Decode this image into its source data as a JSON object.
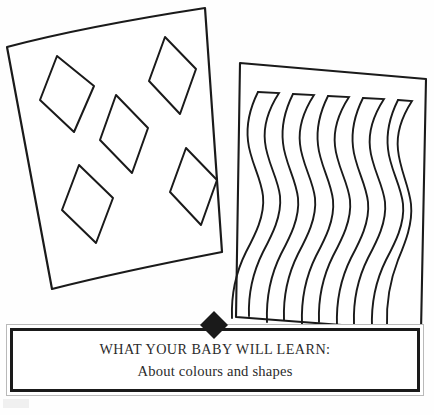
{
  "page": {
    "background_color": "#fefefe",
    "ink_color": "#1a1a1a",
    "width": 434,
    "height": 415
  },
  "illustration": {
    "description": "Line drawing of two overlapping baby stimulation cards",
    "cards": [
      {
        "name": "diamond-pattern-card",
        "label": "Card with diamond shapes",
        "rotation_deg": -12,
        "shape_count": 5,
        "shape_type": "diamond",
        "corners": [
          [
            7,
            47
          ],
          [
            205,
            8
          ],
          [
            222,
            252
          ],
          [
            52,
            289
          ]
        ],
        "shapes": [
          {
            "cx": 77,
            "cy": 93,
            "rx": 26,
            "ry": 38,
            "rot": -10
          },
          {
            "cx": 169,
            "cy": 73,
            "rx": 24,
            "ry": 35,
            "rot": -14
          },
          {
            "cx": 128,
            "cy": 131,
            "rx": 25,
            "ry": 38,
            "rot": -8
          },
          {
            "cx": 85,
            "cy": 199,
            "rx": 26,
            "ry": 38,
            "rot": -9
          },
          {
            "cx": 186,
            "cy": 185,
            "rx": 24,
            "ry": 36,
            "rot": -10
          }
        ]
      },
      {
        "name": "wavy-line-card",
        "label": "Card with vertical wavy stripes",
        "rotation_deg": 3,
        "stripe_count": 5,
        "shape_type": "wave",
        "corners": [
          [
            240,
            63
          ],
          [
            426,
            79
          ],
          [
            421,
            330
          ],
          [
            236,
            317
          ]
        ]
      }
    ]
  },
  "caption": {
    "title": "WHAT YOUR BABY WILL LEARN:",
    "subtitle": "About colours and shapes",
    "marker_icon": "black-diamond-marker",
    "border_color": "#1a1a1a",
    "outer_border_color": "#b9b9b9"
  }
}
